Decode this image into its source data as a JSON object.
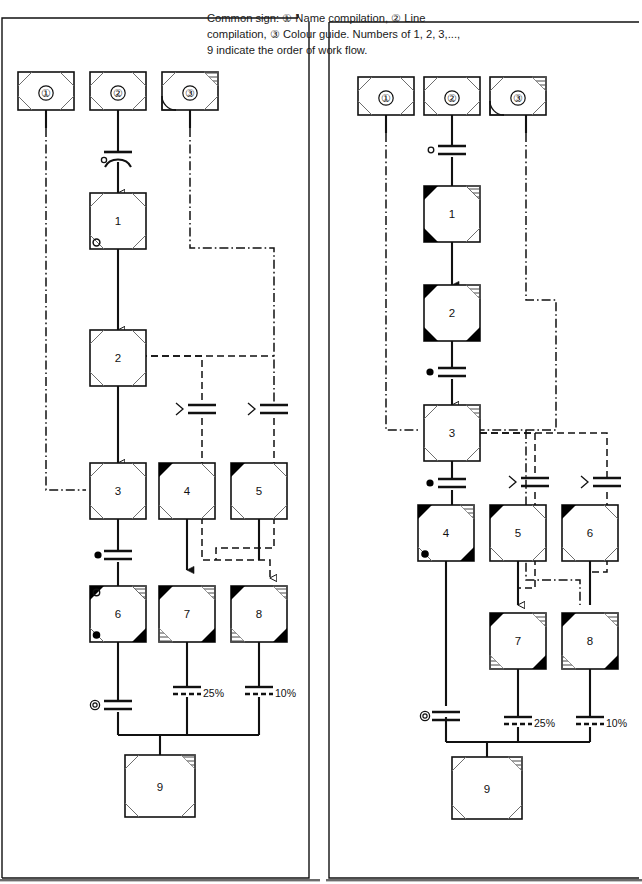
{
  "figure": {
    "caption_lines": [
      "Common sign: ① Name compilation, ② Line",
      "compilation, ③ Colour guide. Numbers of 1, 2, 3,...,",
      "9 indicate the order of work flow."
    ],
    "colors": {
      "ink": "#111111",
      "fill_black": "#000000",
      "paper": "#ffffff",
      "hatch": "#333333"
    }
  },
  "legend": {
    "items": [
      {
        "id": "legend-1",
        "label": "①",
        "meaning": "Name compilation",
        "corners": "plain"
      },
      {
        "id": "legend-2",
        "label": "②",
        "meaning": "Line compilation",
        "corners": "plain"
      },
      {
        "id": "legend-3",
        "label": "③",
        "meaning": "Colour guide",
        "corners": "hatched-arc"
      }
    ]
  },
  "panels": [
    {
      "name": "left-panel",
      "legend_nodes": [
        {
          "label": "①",
          "x": 18,
          "y": 72
        },
        {
          "label": "②",
          "x": 90,
          "y": 72
        },
        {
          "label": "③",
          "x": 162,
          "y": 72
        }
      ],
      "nodes": [
        {
          "label": "1",
          "x": 90,
          "y": 193,
          "marks": [
            "dot-open-bl"
          ]
        },
        {
          "label": "2",
          "x": 90,
          "y": 330,
          "marks": []
        },
        {
          "label": "3",
          "x": 90,
          "y": 463,
          "marks": []
        },
        {
          "label": "4",
          "x": 159,
          "y": 463,
          "marks": [
            "black-tl"
          ]
        },
        {
          "label": "5",
          "x": 231,
          "y": 463,
          "marks": [
            "black-tl"
          ]
        },
        {
          "label": "6",
          "x": 90,
          "y": 586,
          "marks": [
            "black-tl",
            "black-br",
            "dot-open-tl",
            "dot-fill-bl"
          ]
        },
        {
          "label": "7",
          "x": 159,
          "y": 586,
          "marks": [
            "black-tl",
            "black-br"
          ]
        },
        {
          "label": "8",
          "x": 231,
          "y": 586,
          "marks": [
            "black-tl",
            "black-br"
          ]
        },
        {
          "label": "9",
          "x": 125,
          "y": 755,
          "marks": [
            "hatch-tr"
          ]
        }
      ],
      "connector_labels": [
        {
          "text": "25%",
          "x": 200,
          "y": 692
        },
        {
          "text": "10%",
          "x": 272,
          "y": 692
        }
      ],
      "connector_markers": [
        {
          "kind": "circle-open",
          "x": 104,
          "y": 157
        },
        {
          "kind": "dot-filled",
          "x": 100,
          "y": 556
        },
        {
          "kind": "double-circle",
          "x": 96,
          "y": 706
        },
        {
          "kind": "chevron",
          "x": 176,
          "y": 411
        },
        {
          "kind": "chevron",
          "x": 248,
          "y": 411
        }
      ]
    },
    {
      "name": "right-panel",
      "legend_nodes": [
        {
          "label": "①",
          "x": 358,
          "y": 77
        },
        {
          "label": "②",
          "x": 430,
          "y": 77
        },
        {
          "label": "③",
          "x": 490,
          "y": 77
        }
      ],
      "nodes": [
        {
          "label": "1",
          "x": 424,
          "y": 186,
          "marks": [
            "black-tl",
            "black-bl"
          ]
        },
        {
          "label": "2",
          "x": 424,
          "y": 285,
          "marks": [
            "black-tl",
            "black-bl",
            "black-br"
          ]
        },
        {
          "label": "3",
          "x": 424,
          "y": 405,
          "marks": []
        },
        {
          "label": "4",
          "x": 418,
          "y": 505,
          "marks": [
            "black-tl",
            "black-br",
            "dot-fill-bl"
          ]
        },
        {
          "label": "5",
          "x": 490,
          "y": 505,
          "marks": [
            "black-tl"
          ]
        },
        {
          "label": "6",
          "x": 562,
          "y": 505,
          "marks": [
            "black-tl"
          ]
        },
        {
          "label": "7",
          "x": 490,
          "y": 613,
          "marks": [
            "black-tl",
            "black-br"
          ]
        },
        {
          "label": "8",
          "x": 562,
          "y": 613,
          "marks": [
            "black-tl",
            "black-br"
          ]
        },
        {
          "label": "9",
          "x": 452,
          "y": 757,
          "marks": [
            "hatch-tr"
          ]
        }
      ],
      "connector_labels": [
        {
          "text": "25%",
          "x": 532,
          "y": 722
        },
        {
          "text": "10%",
          "x": 604,
          "y": 722
        }
      ],
      "connector_markers": [
        {
          "kind": "circle-open",
          "x": 436,
          "y": 151
        },
        {
          "kind": "dot-filled",
          "x": 430,
          "y": 373
        },
        {
          "kind": "dot-filled",
          "x": 430,
          "y": 484
        },
        {
          "kind": "double-circle",
          "x": 428,
          "y": 718
        },
        {
          "kind": "chevron",
          "x": 507,
          "y": 484
        },
        {
          "kind": "chevron",
          "x": 579,
          "y": 484
        }
      ]
    }
  ]
}
